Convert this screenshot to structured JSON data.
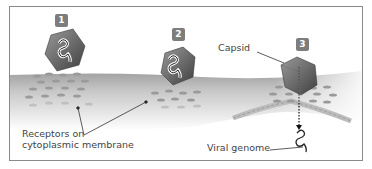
{
  "diagram": {
    "steps": [
      {
        "number": "1",
        "x": 55,
        "y": 14
      },
      {
        "number": "2",
        "x": 172,
        "y": 28
      },
      {
        "number": "3",
        "x": 284,
        "y": 38
      }
    ],
    "labels": {
      "capsid": "Capsid",
      "receptors_line1": "Receptors on",
      "receptors_line2": "cytoplasmic membrane",
      "viral_genome": "Viral genome"
    },
    "colors": {
      "badge": "#7d7d7d",
      "membrane_top": "#a9a9a9",
      "membrane_fade": "#ffffff",
      "capsid_dark": "#555555",
      "capsid_light": "#8a8a8a",
      "receptor": "#9a9a9a",
      "frame": "#8a8a8a",
      "text": "#444444"
    }
  }
}
